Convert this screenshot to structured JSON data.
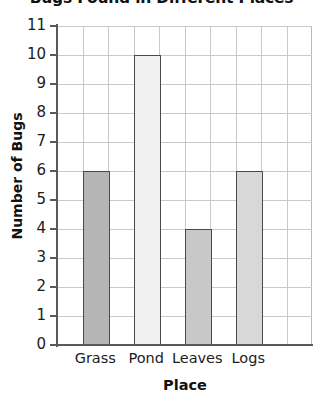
{
  "chart_data": {
    "type": "bar",
    "title": "Bugs Found in Different Places",
    "xlabel": "Place",
    "ylabel": "Number of Bugs",
    "categories": [
      "Grass",
      "Pond",
      "Leaves",
      "Logs"
    ],
    "values": [
      6,
      10,
      4,
      6
    ],
    "ylim": [
      0,
      11
    ],
    "ytick_labels": [
      "0",
      "1",
      "2",
      "3",
      "4",
      "5",
      "6",
      "7",
      "8",
      "9",
      "10",
      "11"
    ],
    "grid": true,
    "legend": "none",
    "bar_colors": [
      "#b5b5b5",
      "#f0f0f0",
      "#c8c8c8",
      "#d8d8d8"
    ],
    "bar_edge_color": "#4a4a4a",
    "grid_color": "#c9c9c9",
    "axis_color": "#5a5a5a",
    "text_color": "#1b1b1b",
    "background": "#ffffff"
  }
}
